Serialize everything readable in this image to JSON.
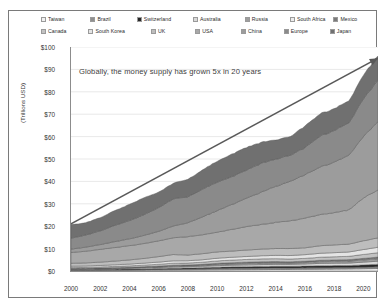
{
  "chart_data": {
    "type": "area",
    "stacked": true,
    "title": "",
    "subtitle": "",
    "annotation": "Globally, the money supply has grown 5x in 20 years",
    "xlabel": "",
    "ylabel": "(Trillions USD)",
    "xlim": [
      2000,
      2021
    ],
    "ylim": [
      0,
      100
    ],
    "ytick_labels": [
      "$100",
      "$90",
      "$80",
      "$70",
      "$60",
      "$50",
      "$40",
      "$30",
      "$20",
      "$10",
      "$0"
    ],
    "ytick_values": [
      100,
      90,
      80,
      70,
      60,
      50,
      40,
      30,
      20,
      10,
      0
    ],
    "xtick_labels": [
      "2000",
      "2002",
      "2004",
      "2006",
      "2008",
      "2010",
      "2012",
      "2014",
      "2016",
      "2018",
      "2020"
    ],
    "xtick_values": [
      2000,
      2002,
      2004,
      2006,
      2008,
      2010,
      2012,
      2014,
      2016,
      2018,
      2020
    ],
    "grid": true,
    "legend_position": "top",
    "x": [
      2000,
      2001,
      2002,
      2003,
      2004,
      2005,
      2006,
      2007,
      2008,
      2009,
      2010,
      2011,
      2012,
      2013,
      2014,
      2015,
      2016,
      2017,
      2018,
      2019,
      2020,
      2021
    ],
    "series": [
      {
        "name": "Taiwan",
        "color": "#f2f2f2",
        "values": [
          0.25,
          0.27,
          0.29,
          0.32,
          0.35,
          0.38,
          0.4,
          0.43,
          0.46,
          0.5,
          0.54,
          0.57,
          0.6,
          0.63,
          0.67,
          0.71,
          0.76,
          0.81,
          0.85,
          0.9,
          1.0,
          1.1
        ]
      },
      {
        "name": "Brazil",
        "color": "#8f8f8f",
        "values": [
          0.15,
          0.14,
          0.15,
          0.17,
          0.2,
          0.25,
          0.3,
          0.38,
          0.42,
          0.48,
          0.58,
          0.62,
          0.64,
          0.67,
          0.7,
          0.62,
          0.64,
          0.68,
          0.66,
          0.64,
          0.7,
          0.78
        ]
      },
      {
        "name": "Switzerland",
        "color": "#262626",
        "values": [
          0.28,
          0.29,
          0.31,
          0.34,
          0.36,
          0.38,
          0.4,
          0.42,
          0.45,
          0.52,
          0.58,
          0.64,
          0.68,
          0.72,
          0.74,
          0.76,
          0.8,
          0.86,
          0.88,
          0.9,
          1.0,
          1.1
        ]
      },
      {
        "name": "Australia",
        "color": "#d9d9d9",
        "values": [
          0.25,
          0.26,
          0.29,
          0.33,
          0.38,
          0.42,
          0.47,
          0.55,
          0.58,
          0.62,
          0.7,
          0.76,
          0.8,
          0.82,
          0.86,
          0.88,
          0.95,
          1.05,
          1.08,
          1.1,
          1.25,
          1.4
        ]
      },
      {
        "name": "Russia",
        "color": "#9e9e9e",
        "values": [
          0.04,
          0.05,
          0.07,
          0.09,
          0.12,
          0.17,
          0.25,
          0.35,
          0.38,
          0.42,
          0.52,
          0.6,
          0.66,
          0.72,
          0.66,
          0.6,
          0.66,
          0.76,
          0.8,
          0.86,
          0.95,
          1.05
        ]
      },
      {
        "name": "South Africa",
        "color": "#ededed",
        "values": [
          0.07,
          0.07,
          0.08,
          0.09,
          0.11,
          0.13,
          0.15,
          0.17,
          0.16,
          0.18,
          0.2,
          0.21,
          0.22,
          0.22,
          0.22,
          0.21,
          0.22,
          0.24,
          0.24,
          0.24,
          0.26,
          0.28
        ]
      },
      {
        "name": "Mexico",
        "color": "#7a7a7a",
        "values": [
          0.1,
          0.11,
          0.12,
          0.13,
          0.15,
          0.18,
          0.21,
          0.24,
          0.23,
          0.25,
          0.29,
          0.31,
          0.34,
          0.36,
          0.37,
          0.35,
          0.34,
          0.36,
          0.4,
          0.44,
          0.46,
          0.5
        ]
      },
      {
        "name": "Canada",
        "color": "#c2c2c2",
        "values": [
          0.45,
          0.47,
          0.5,
          0.56,
          0.64,
          0.72,
          0.81,
          0.93,
          0.88,
          0.96,
          1.1,
          1.16,
          1.22,
          1.26,
          1.28,
          1.22,
          1.26,
          1.38,
          1.42,
          1.48,
          1.75,
          1.95
        ]
      },
      {
        "name": "South Korea",
        "color": "#e4e4e4",
        "values": [
          0.55,
          0.6,
          0.68,
          0.74,
          0.8,
          0.88,
          0.98,
          1.08,
          1.02,
          1.1,
          1.2,
          1.26,
          1.32,
          1.4,
          1.48,
          1.56,
          1.66,
          1.76,
          1.84,
          1.94,
          2.2,
          2.45
        ]
      },
      {
        "name": "UK",
        "color": "#bdbdbd",
        "values": [
          1.3,
          1.35,
          1.48,
          1.66,
          1.88,
          2.1,
          2.45,
          2.8,
          2.55,
          2.7,
          2.82,
          2.76,
          2.88,
          2.96,
          3.06,
          3.12,
          3.06,
          3.36,
          3.44,
          3.5,
          3.9,
          4.2
        ]
      },
      {
        "name": "USA",
        "color": "#a8a8a8",
        "values": [
          4.8,
          5.2,
          5.7,
          6.05,
          6.35,
          6.65,
          7.05,
          7.45,
          8.2,
          8.5,
          8.8,
          9.65,
          10.45,
          11.0,
          11.65,
          12.35,
          13.2,
          13.85,
          14.4,
          15.3,
          19.1,
          21.5
        ]
      },
      {
        "name": "China",
        "color": "#9c9c9c",
        "values": [
          1.5,
          1.8,
          2.15,
          2.65,
          3.05,
          3.6,
          4.25,
          5.25,
          6.2,
          7.95,
          9.6,
          11.1,
          12.7,
          14.4,
          16.1,
          17.6,
          19.4,
          21.1,
          22.6,
          24.4,
          27.5,
          30.5
        ]
      },
      {
        "name": "Europe",
        "color": "#8a8a8a",
        "values": [
          4.9,
          5.4,
          6.1,
          7.25,
          8.15,
          9.25,
          10.6,
          12.05,
          11.6,
          12.4,
          12.7,
          12.4,
          12.5,
          12.9,
          12.1,
          11.6,
          12.1,
          13.8,
          14.1,
          14.4,
          16.8,
          18.5
        ]
      },
      {
        "name": "Japan",
        "color": "#707070",
        "values": [
          6.0,
          5.5,
          5.9,
          6.6,
          7.2,
          7.6,
          6.9,
          7.0,
          7.8,
          8.6,
          9.3,
          10.05,
          10.1,
          9.4,
          8.6,
          8.3,
          9.7,
          9.9,
          9.8,
          9.8,
          10.6,
          11.0
        ]
      }
    ]
  },
  "legend": {
    "row1": [
      {
        "label": "Taiwan",
        "color": "#f2f2f2"
      },
      {
        "label": "Brazil",
        "color": "#8f8f8f"
      },
      {
        "label": "Switzerland",
        "color": "#262626"
      },
      {
        "label": "Australia",
        "color": "#d9d9d9"
      },
      {
        "label": "Russia",
        "color": "#9e9e9e"
      },
      {
        "label": "South Africa",
        "color": "#ededed"
      },
      {
        "label": "Mexico",
        "color": "#7a7a7a"
      }
    ],
    "row2": [
      {
        "label": "Canada",
        "color": "#c2c2c2"
      },
      {
        "label": "South Korea",
        "color": "#e4e4e4"
      },
      {
        "label": "UK",
        "color": "#bdbdbd"
      },
      {
        "label": "USA",
        "color": "#a8a8a8"
      },
      {
        "label": "China",
        "color": "#9c9c9c"
      },
      {
        "label": "Europe",
        "color": "#8a8a8a"
      },
      {
        "label": "Japan",
        "color": "#707070"
      }
    ]
  },
  "arrow": {
    "name": "growth-arrow",
    "color": "#595959",
    "start": {
      "year": 2000,
      "value": 21
    },
    "end": {
      "year": 2021,
      "value": 95
    }
  }
}
